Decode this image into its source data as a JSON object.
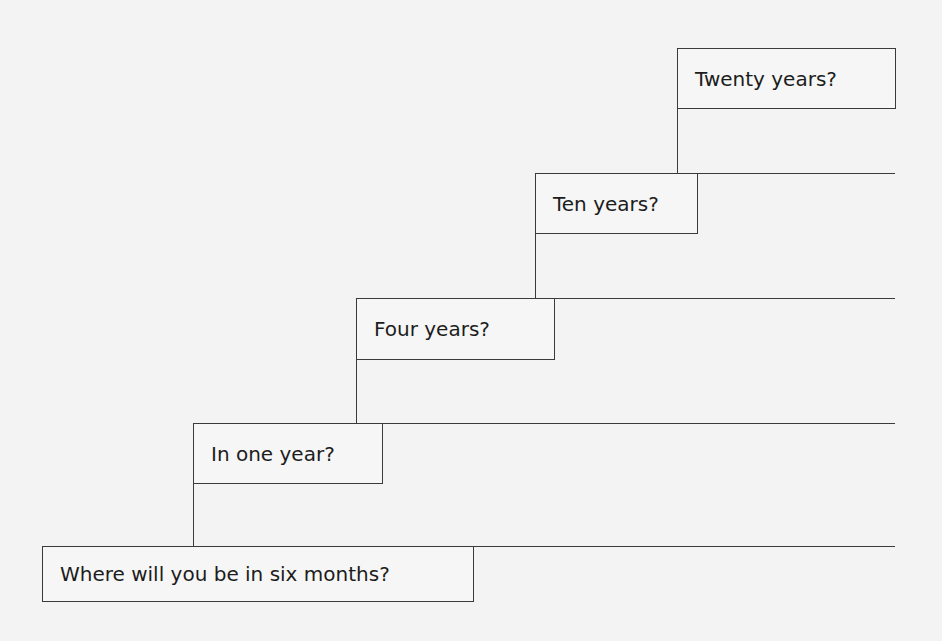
{
  "diagram": {
    "type": "staircase",
    "steps": [
      {
        "label": "Where will you be in six months?"
      },
      {
        "label": "In one year?"
      },
      {
        "label": "Four years?"
      },
      {
        "label": "Ten years?"
      },
      {
        "label": "Twenty years?"
      }
    ],
    "colors": {
      "line": "#3a3a3a",
      "text": "#1c1c1c",
      "background": "#f3f3f3"
    }
  }
}
